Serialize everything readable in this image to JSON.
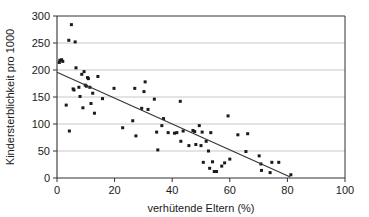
{
  "chart_data": {
    "type": "scatter",
    "title": "",
    "xlabel": "verhütende Eltern (%)",
    "ylabel": "Kindersterblichkeit pro 1000",
    "xlim": [
      0,
      100
    ],
    "ylim": [
      0,
      300
    ],
    "xticks": [
      0,
      20,
      40,
      60,
      80,
      100
    ],
    "yticks": [
      0,
      50,
      100,
      150,
      200,
      250,
      300
    ],
    "xtick_labels": [
      "0",
      "20",
      "40",
      "60",
      "80",
      "100"
    ],
    "ytick_labels": [
      "0",
      "50",
      "100",
      "150",
      "200",
      "250",
      "300"
    ],
    "grid": "horizontal",
    "grid_color": "#b0b0b0",
    "legend": "none",
    "marker_color": "#1a1a1a",
    "marker_shape": "square",
    "marker_size_px": 3,
    "trendline": {
      "visible": true,
      "color": "#333333",
      "x_start": 0,
      "y_start": 196,
      "x_end": 81,
      "y_end": 2
    },
    "points": [
      [
        0.8,
        214
      ],
      [
        1.0,
        218
      ],
      [
        1.6,
        219
      ],
      [
        2.0,
        216
      ],
      [
        3.2,
        135
      ],
      [
        4.1,
        255
      ],
      [
        4.3,
        87
      ],
      [
        5.0,
        284
      ],
      [
        5.6,
        165
      ],
      [
        5.9,
        163
      ],
      [
        6.3,
        252
      ],
      [
        6.6,
        204
      ],
      [
        7.6,
        168
      ],
      [
        8.0,
        151
      ],
      [
        8.6,
        192
      ],
      [
        9.0,
        130
      ],
      [
        9.4,
        197
      ],
      [
        9.8,
        172
      ],
      [
        10.2,
        170
      ],
      [
        10.6,
        186
      ],
      [
        10.9,
        184
      ],
      [
        11.4,
        168
      ],
      [
        11.8,
        138
      ],
      [
        12.4,
        157
      ],
      [
        13.0,
        120
      ],
      [
        14.2,
        188
      ],
      [
        15.8,
        147
      ],
      [
        19.8,
        166
      ],
      [
        22.8,
        93
      ],
      [
        26.3,
        106
      ],
      [
        27.0,
        166
      ],
      [
        27.4,
        78
      ],
      [
        29.4,
        129
      ],
      [
        30.2,
        160
      ],
      [
        30.6,
        178
      ],
      [
        31.6,
        127
      ],
      [
        33.8,
        146
      ],
      [
        34.6,
        85
      ],
      [
        35.0,
        52
      ],
      [
        36.4,
        97
      ],
      [
        37.0,
        110
      ],
      [
        38.6,
        84
      ],
      [
        40.8,
        83
      ],
      [
        41.6,
        84
      ],
      [
        42.8,
        142
      ],
      [
        43.0,
        68
      ],
      [
        43.8,
        87
      ],
      [
        45.8,
        60
      ],
      [
        47.2,
        88
      ],
      [
        47.8,
        86
      ],
      [
        48.2,
        62
      ],
      [
        49.4,
        97
      ],
      [
        50.0,
        60
      ],
      [
        50.4,
        85
      ],
      [
        50.8,
        29
      ],
      [
        51.8,
        68
      ],
      [
        52.6,
        50
      ],
      [
        53.0,
        18
      ],
      [
        53.4,
        84
      ],
      [
        54.0,
        30
      ],
      [
        54.6,
        12
      ],
      [
        55.4,
        12
      ],
      [
        57.2,
        22
      ],
      [
        58.2,
        28
      ],
      [
        59.4,
        115
      ],
      [
        60.0,
        35
      ],
      [
        62.8,
        80
      ],
      [
        65.6,
        49
      ],
      [
        66.2,
        82
      ],
      [
        70.2,
        41
      ],
      [
        70.8,
        26
      ],
      [
        71.0,
        14
      ],
      [
        74.0,
        10
      ],
      [
        74.6,
        29
      ],
      [
        77.0,
        29
      ],
      [
        81.2,
        6
      ]
    ]
  },
  "axis": {
    "x_title": "verhütende Eltern (%)",
    "y_title": "Kindersterblichkeit pro 1000"
  }
}
